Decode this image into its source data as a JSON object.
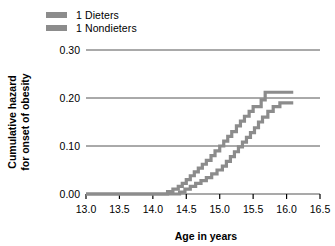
{
  "chart_data": {
    "type": "line",
    "title": "",
    "xlabel": "Age in years",
    "ylabel": "Cumulative hazard for onset of obesity",
    "ylabel_line1": "Cumulative hazard",
    "ylabel_line2": "for onset of obesity",
    "xlim": [
      13.0,
      16.5
    ],
    "ylim": [
      0.0,
      0.3
    ],
    "xticks": [
      "13.0",
      "13.5",
      "14.0",
      "14.5",
      "15.0",
      "15.5",
      "16.0",
      "16.5"
    ],
    "xtick_values": [
      13.0,
      13.5,
      14.0,
      14.5,
      15.0,
      15.5,
      16.0,
      16.5
    ],
    "yticks": [
      "0.00",
      "0.10",
      "0.20",
      "0.30"
    ],
    "ytick_values": [
      0.0,
      0.1,
      0.2,
      0.3
    ],
    "grid": "horizontal",
    "legend_position": "top-left",
    "step_style": "post",
    "series": [
      {
        "name": "1 Dieters",
        "color": "#8c8c8c",
        "x": [
          13.0,
          14.22,
          14.3,
          14.38,
          14.44,
          14.5,
          14.56,
          14.62,
          14.68,
          14.74,
          14.8,
          14.87,
          14.93,
          15.0,
          15.06,
          15.12,
          15.18,
          15.25,
          15.31,
          15.37,
          15.44,
          15.5,
          15.62,
          15.68,
          16.1
        ],
        "y": [
          0.0,
          0.005,
          0.01,
          0.016,
          0.022,
          0.03,
          0.038,
          0.046,
          0.054,
          0.062,
          0.07,
          0.08,
          0.09,
          0.1,
          0.11,
          0.12,
          0.13,
          0.142,
          0.152,
          0.162,
          0.172,
          0.182,
          0.196,
          0.212,
          0.212
        ]
      },
      {
        "name": "1 Nondieters",
        "color": "#8c8c8c",
        "x": [
          13.0,
          14.4,
          14.48,
          14.56,
          14.64,
          14.72,
          14.8,
          14.88,
          14.96,
          15.04,
          15.1,
          15.16,
          15.22,
          15.28,
          15.34,
          15.4,
          15.46,
          15.52,
          15.58,
          15.64,
          15.72,
          15.8,
          15.9,
          16.1
        ],
        "y": [
          0.0,
          0.004,
          0.01,
          0.016,
          0.022,
          0.028,
          0.034,
          0.042,
          0.05,
          0.058,
          0.068,
          0.078,
          0.088,
          0.098,
          0.108,
          0.118,
          0.128,
          0.138,
          0.15,
          0.16,
          0.172,
          0.182,
          0.19,
          0.19
        ]
      }
    ]
  },
  "legend": {
    "items": [
      {
        "label": "1 Dieters",
        "color": "#8c8c8c"
      },
      {
        "label": "1 Nondieters",
        "color": "#8c8c8c"
      }
    ]
  },
  "axes": {
    "x_title": "Age in years",
    "y_title_line1": "Cumulative hazard",
    "y_title_line2": "for onset of obesity"
  },
  "colors": {
    "series_gray": "#8c8c8c",
    "axis": "#000000",
    "grid": "#555555",
    "background": "#ffffff"
  }
}
